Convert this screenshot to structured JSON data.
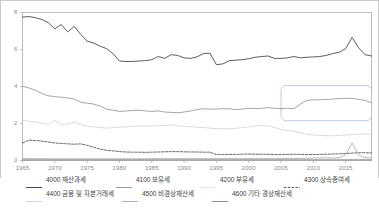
{
  "chart_data": {
    "type": "line",
    "title": "",
    "xlabel": "",
    "ylabel": "",
    "xlim": [
      1965,
      2019
    ],
    "ylim": [
      0,
      8
    ],
    "yticks": [
      0,
      2,
      4,
      6,
      8
    ],
    "xticks": [
      1965,
      1970,
      1975,
      1980,
      1985,
      1990,
      1995,
      2000,
      2005,
      2010,
      2015
    ],
    "grid": false,
    "legend_position": "bottom",
    "x": [
      1965,
      1966,
      1967,
      1968,
      1969,
      1970,
      1971,
      1972,
      1973,
      1974,
      1975,
      1976,
      1977,
      1978,
      1979,
      1980,
      1981,
      1982,
      1983,
      1984,
      1985,
      1986,
      1987,
      1988,
      1989,
      1990,
      1991,
      1992,
      1993,
      1994,
      1995,
      1996,
      1997,
      1998,
      1999,
      2000,
      2001,
      2002,
      2003,
      2004,
      2005,
      2006,
      2007,
      2008,
      2009,
      2010,
      2011,
      2012,
      2013,
      2014,
      2015,
      2016,
      2017,
      2018,
      2019
    ],
    "series": [
      {
        "name": "4000 재산과세",
        "code": "4000",
        "color": "#4a4a4a",
        "style": "solid",
        "values": [
          7.75,
          7.78,
          7.72,
          7.62,
          7.45,
          7.12,
          7.35,
          6.95,
          7.25,
          6.82,
          6.45,
          6.35,
          6.18,
          6.05,
          5.78,
          5.38,
          5.35,
          5.35,
          5.38,
          5.4,
          5.45,
          5.62,
          5.52,
          5.72,
          5.68,
          5.55,
          5.52,
          5.6,
          5.78,
          5.8,
          5.18,
          5.22,
          5.4,
          5.42,
          5.45,
          5.5,
          5.58,
          5.62,
          5.65,
          5.52,
          5.52,
          5.55,
          5.62,
          5.55,
          5.58,
          5.6,
          5.62,
          5.68,
          5.78,
          5.85,
          6.05,
          6.65,
          6.1,
          5.72,
          5.65
        ]
      },
      {
        "name": "4100 보유세",
        "code": "4100",
        "color": "#9b9b9b",
        "style": "solid",
        "values": [
          4.02,
          3.92,
          3.8,
          3.62,
          3.5,
          3.45,
          3.42,
          3.38,
          3.32,
          3.15,
          3.1,
          3.05,
          2.95,
          2.78,
          2.72,
          2.65,
          2.68,
          2.7,
          2.72,
          2.68,
          2.65,
          2.68,
          2.62,
          2.6,
          2.58,
          2.62,
          2.68,
          2.75,
          2.8,
          2.78,
          2.78,
          2.8,
          2.8,
          2.75,
          2.78,
          2.82,
          2.8,
          2.82,
          2.86,
          2.82,
          2.8,
          2.82,
          2.8,
          3.05,
          3.25,
          3.28,
          3.28,
          3.3,
          3.32,
          3.35,
          3.36,
          3.36,
          3.3,
          3.25,
          3.12
        ]
      },
      {
        "name": "4200 부유세",
        "code": "4200",
        "color": "#c9c9c9",
        "style": "dotted",
        "values": [
          2.18,
          2.12,
          2.08,
          2.02,
          1.95,
          2.18,
          1.95,
          1.98,
          2.08,
          1.95,
          1.85,
          1.82,
          1.78,
          1.75,
          1.78,
          1.8,
          1.82,
          1.85,
          1.86,
          1.88,
          1.86,
          1.88,
          1.9,
          1.92,
          1.88,
          1.85,
          1.82,
          1.8,
          1.78,
          1.75,
          1.72,
          1.72,
          1.72,
          1.74,
          1.78,
          1.82,
          1.86,
          1.9,
          1.88,
          1.78,
          1.68,
          1.62,
          1.58,
          1.5,
          1.42,
          1.38,
          1.36,
          1.34,
          1.34,
          1.36,
          1.38,
          1.4,
          1.42,
          1.44,
          1.42
        ]
      },
      {
        "name": "4300 상속증여세",
        "code": "4300",
        "color": "#5a5a5a",
        "style": "dashed",
        "values": [
          0.95,
          1.1,
          1.08,
          1.05,
          1.0,
          0.95,
          0.92,
          0.9,
          0.88,
          0.9,
          0.82,
          0.72,
          0.62,
          0.55,
          0.52,
          0.48,
          0.46,
          0.45,
          0.45,
          0.44,
          0.45,
          0.46,
          0.47,
          0.48,
          0.48,
          0.47,
          0.46,
          0.46,
          0.45,
          0.45,
          0.32,
          0.32,
          0.33,
          0.33,
          0.34,
          0.35,
          0.34,
          0.34,
          0.33,
          0.32,
          0.32,
          0.33,
          0.34,
          0.33,
          0.32,
          0.32,
          0.33,
          0.34,
          0.35,
          0.36,
          0.38,
          0.4,
          0.42,
          0.42,
          0.41
        ]
      },
      {
        "name": "4400 금융 및 자본거래세",
        "code": "4400",
        "color": "#d4d4d4",
        "style": "solid",
        "values": [
          0.06,
          0.06,
          0.06,
          0.06,
          0.06,
          0.06,
          0.06,
          0.06,
          0.06,
          0.06,
          0.06,
          0.06,
          0.06,
          0.06,
          0.06,
          0.06,
          0.06,
          0.06,
          0.06,
          0.06,
          0.06,
          0.06,
          0.06,
          0.06,
          0.06,
          0.06,
          0.06,
          0.06,
          0.06,
          0.06,
          0.06,
          0.06,
          0.06,
          0.06,
          0.06,
          0.06,
          0.06,
          0.06,
          0.06,
          0.06,
          0.06,
          0.06,
          0.06,
          0.06,
          0.06,
          0.06,
          0.06,
          0.06,
          0.06,
          0.06,
          0.06,
          0.06,
          0.06,
          0.06,
          0.06
        ]
      },
      {
        "name": "4500 비경상재산세",
        "code": "4500",
        "color": "#b0b0b0",
        "style": "solid",
        "values": [
          0.1,
          0.1,
          0.1,
          0.1,
          0.09,
          0.09,
          0.09,
          0.09,
          0.09,
          0.09,
          0.09,
          0.09,
          0.09,
          0.09,
          0.09,
          0.09,
          0.09,
          0.09,
          0.09,
          0.09,
          0.1,
          0.1,
          0.1,
          0.1,
          0.1,
          0.1,
          0.1,
          0.1,
          0.1,
          0.1,
          0.1,
          0.1,
          0.1,
          0.1,
          0.1,
          0.1,
          0.1,
          0.1,
          0.1,
          0.1,
          0.1,
          0.11,
          0.11,
          0.11,
          0.12,
          0.13,
          0.14,
          0.14,
          0.14,
          0.15,
          0.3,
          0.95,
          0.3,
          0.15,
          0.14
        ]
      },
      {
        "name": "4600 기타 경상재산세",
        "code": "4600",
        "color": "#8c8c8c",
        "style": "solid",
        "values": [
          0.03,
          0.03,
          0.03,
          0.03,
          0.03,
          0.03,
          0.03,
          0.03,
          0.03,
          0.03,
          0.03,
          0.03,
          0.03,
          0.03,
          0.03,
          0.03,
          0.03,
          0.03,
          0.03,
          0.03,
          0.03,
          0.03,
          0.03,
          0.03,
          0.03,
          0.03,
          0.03,
          0.03,
          0.03,
          0.03,
          0.03,
          0.03,
          0.03,
          0.03,
          0.03,
          0.03,
          0.03,
          0.03,
          0.03,
          0.03,
          0.03,
          0.03,
          0.03,
          0.03,
          0.03,
          0.03,
          0.03,
          0.03,
          0.03,
          0.03,
          0.03,
          0.03,
          0.03,
          0.03,
          0.03
        ]
      }
    ],
    "annotations": [
      {
        "name": "highlight-box",
        "shape": "rounded-rectangle",
        "x_range": [
          2005,
          2019
        ],
        "y_range": [
          2.15,
          4.05
        ],
        "color": "#b8c4d9"
      }
    ]
  },
  "axes": {
    "yticks": [
      "0",
      "2",
      "4",
      "6",
      "8"
    ],
    "xticks": [
      "1965",
      "1970",
      "1975",
      "1980",
      "1985",
      "1990",
      "1995",
      "2000",
      "2005",
      "2010",
      "2015"
    ]
  },
  "legend": {
    "rows": [
      [
        {
          "label": "4000 재산과세",
          "color": "#4a4a4a",
          "style": "solid"
        },
        {
          "label": "4100 보유세",
          "color": "#9b9b9b",
          "style": "solid"
        },
        {
          "label": "4200 부유세",
          "color": "#c9c9c9",
          "style": "dotted"
        },
        {
          "label": "4300 상속증여세",
          "color": "#5a5a5a",
          "style": "dashed"
        }
      ],
      [
        {
          "label": "4400 금융 및 자본거래세",
          "color": "#d4d4d4",
          "style": "solid"
        },
        {
          "label": "4500 비경상재산세",
          "color": "#b0b0b0",
          "style": "solid"
        },
        {
          "label": "4600 기타 경상재산세",
          "color": "#8c8c8c",
          "style": "solid"
        }
      ]
    ]
  }
}
